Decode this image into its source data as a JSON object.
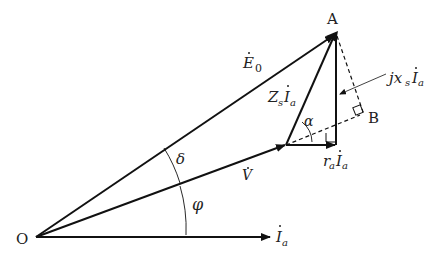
{
  "diagram": {
    "type": "phasor-diagram",
    "colors": {
      "line": "#111111",
      "background": "#ffffff"
    },
    "points": {
      "O": {
        "label": "O",
        "x": 36,
        "y": 237
      },
      "A": {
        "label": "A",
        "x": 335,
        "y": 35
      },
      "B": {
        "label": "B",
        "x": 360,
        "y": 112
      },
      "V_tip": {
        "x": 286,
        "y": 145
      },
      "R_tip": {
        "x": 336,
        "y": 145
      },
      "Ia_tip": {
        "x": 270,
        "y": 237
      }
    },
    "labels": {
      "E0": {
        "main": "E",
        "sub": "0"
      },
      "V": {
        "main": "V"
      },
      "Ia": {
        "main": "I",
        "sub": "a"
      },
      "ZsIa": {
        "z": "Z",
        "zs": "s",
        "i": "I",
        "is": "a"
      },
      "raIa": {
        "r": "r",
        "rs": "a",
        "i": "I",
        "is": "a"
      },
      "jxsIa": {
        "j": "jx",
        "js": "s",
        "i": "I",
        "is": "a"
      },
      "delta": "δ",
      "phi": "φ",
      "alpha": "α"
    }
  }
}
